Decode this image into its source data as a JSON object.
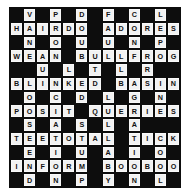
{
  "puzzle": {
    "type": "crossword",
    "title": "Crossword Puzzle Grid",
    "columns": 13,
    "rows": 13,
    "colors": {
      "block": "#0d0d0d",
      "open_cell": "#f2f2f2",
      "letter": "#111111",
      "page_background": "#ffffff"
    },
    "block_char": ".",
    "grid_rows": [
      ".V.P.D.F.C.L.",
      "HAIRDO.ADORES",
      ".N.O.U.U.N.P.",
      "WEAN.BULLFROG",
      "..U.L.T.L.R..",
      "BLINKED.BASIN",
      ".O.C.D.L.G.N.",
      "POSIT.QUERIES",
      ".S.A.S.L.A...",
      "TEETOTAL.TICK",
      ".E.I.U.A.I.O.",
      "INFORM.BOOBOO",
      ".D.N.P.Y.N.L."
    ],
    "across_answers": [
      "HAIRDO",
      "ADORES",
      "WEAN",
      "BULLFROG",
      "BLINKED",
      "BASIN",
      "POSIT",
      "QUERIES",
      "TEETOTAL",
      "TICK",
      "INFORM",
      "BOOBOO"
    ],
    "down_answers": [
      "VANEES",
      "PROUST",
      "DOUBLE",
      "FUTILITY",
      "CONGANIL",
      "LPRINCOL"
    ]
  }
}
